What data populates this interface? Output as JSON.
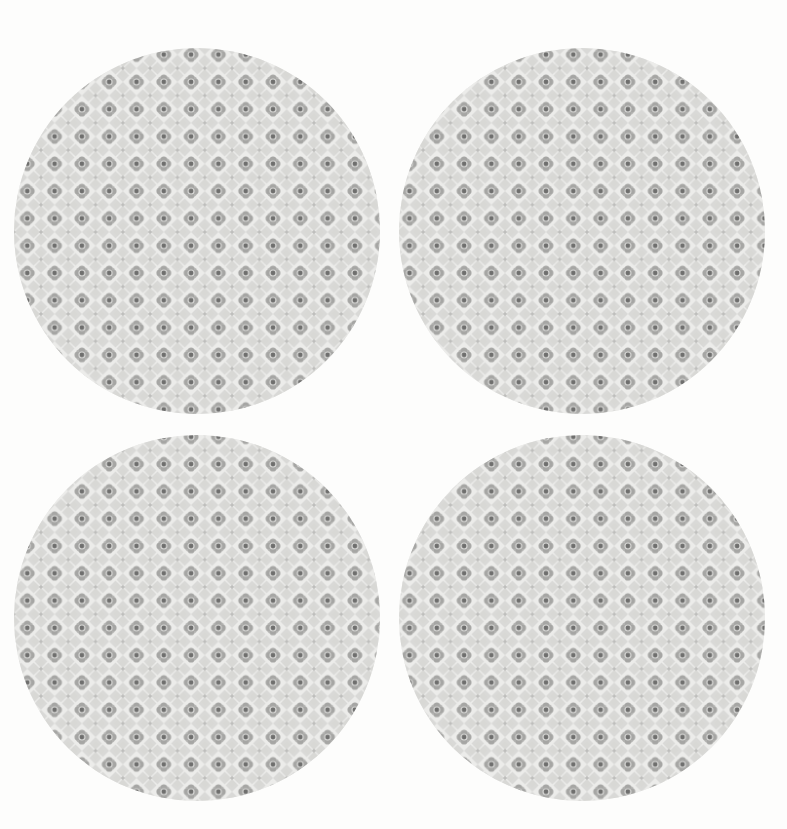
{
  "artwork": {
    "title": "Four patterned circles",
    "description": "A 2 by 2 arrangement of four large tangent circles, each filled with a repeating grey quatrefoil lattice damask motif on an off-white background.",
    "canvas": {
      "width": 787,
      "height": 829,
      "background_color": "#fdfdfc"
    },
    "palette": {
      "background": "#fdfdfc",
      "circle_fill": "#ececea",
      "lattice_light": "#d8d8d6",
      "lattice_mid": "#b9b9b7",
      "lattice_dark": "#9d9d9b",
      "dot_dark": "#70706f",
      "diamond_light": "#e8e8e6"
    },
    "pattern": {
      "name": "quatrefoil-lattice-damask",
      "tile_size_px": 27.3,
      "motif": "quatrefoil with dark centre dot at each lattice node, linked by woven bands, light diamond voids between nodes",
      "repeat": "grid"
    },
    "circles": [
      {
        "id": "circle-top-left",
        "label": "Top left circle",
        "cx": 197,
        "cy": 231,
        "r": 183,
        "diameter": 366
      },
      {
        "id": "circle-top-right",
        "label": "Top right circle",
        "cx": 582,
        "cy": 231,
        "r": 183,
        "diameter": 366
      },
      {
        "id": "circle-bottom-left",
        "label": "Bottom left circle",
        "cx": 197,
        "cy": 618,
        "r": 183,
        "diameter": 366
      },
      {
        "id": "circle-bottom-right",
        "label": "Bottom right circle",
        "cx": 582,
        "cy": 618,
        "r": 183,
        "diameter": 366
      }
    ]
  }
}
